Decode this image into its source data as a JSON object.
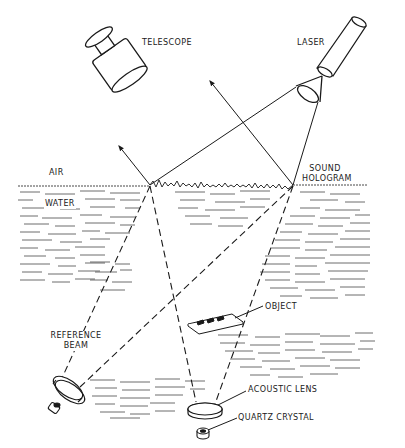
{
  "diagram": {
    "labels": {
      "telescope": "TELESCOPE",
      "laser": "LASER",
      "air": "AIR",
      "water": "WATER",
      "sound_hologram_line1": "SOUND",
      "sound_hologram_line2": "HOLOGRAM",
      "object": "OBJECT",
      "reference_beam_line1": "REFERENCE",
      "reference_beam_line2": "BEAM",
      "acoustic_lens": "ACOUSTIC LENS",
      "quartz_crystal": "QUARTZ CRYSTAL"
    },
    "colors": {
      "ink": "#1a1a1a",
      "background": "#ffffff",
      "water_hatch": "#2a2a2a"
    }
  }
}
